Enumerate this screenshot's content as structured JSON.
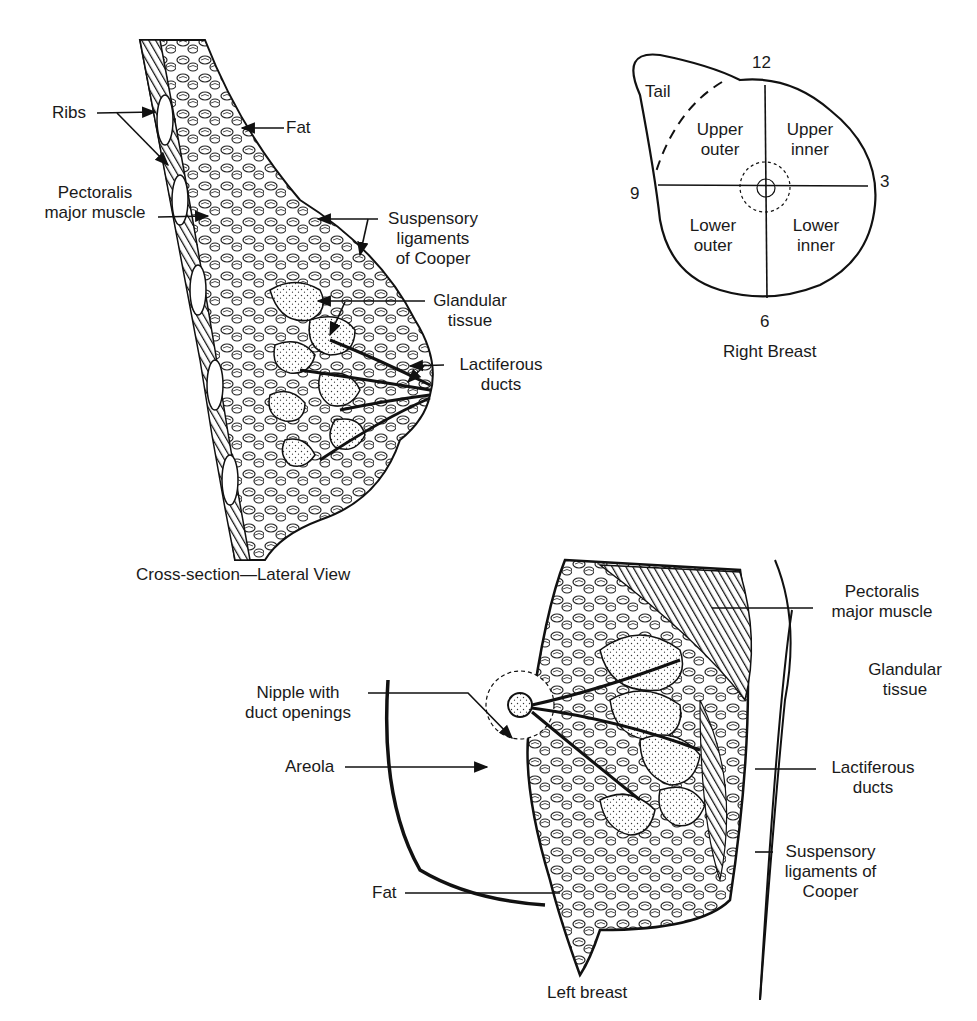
{
  "lateral_view": {
    "caption": "Cross-section—Lateral View",
    "labels": {
      "ribs": "Ribs",
      "fat": "Fat",
      "pectoralis_line1": "Pectoralis",
      "pectoralis_line2": "major muscle",
      "suspensory_line1": "Suspensory",
      "suspensory_line2": "ligaments",
      "suspensory_line3": "of Cooper",
      "glandular_line1": "Glandular",
      "glandular_line2": "tissue",
      "lactiferous_line1": "Lactiferous",
      "lactiferous_line2": "ducts"
    }
  },
  "quadrant_diagram": {
    "caption": "Right Breast",
    "clock": {
      "top": "12",
      "right": "3",
      "bottom": "6",
      "left": "9"
    },
    "regions": {
      "tail": "Tail",
      "upper_outer_1": "Upper",
      "upper_outer_2": "outer",
      "upper_inner_1": "Upper",
      "upper_inner_2": "inner",
      "lower_outer_1": "Lower",
      "lower_outer_2": "outer",
      "lower_inner_1": "Lower",
      "lower_inner_2": "inner"
    }
  },
  "frontal_view": {
    "caption": "Left breast",
    "labels": {
      "pectoralis_line1": "Pectoralis",
      "pectoralis_line2": "major muscle",
      "glandular_line1": "Glandular",
      "glandular_line2": "tissue",
      "nipple_line1": "Nipple with",
      "nipple_line2": "duct openings",
      "areola": "Areola",
      "lactiferous_line1": "Lactiferous",
      "lactiferous_line2": "ducts",
      "suspensory_line1": "Suspensory",
      "suspensory_line2": "ligaments of",
      "suspensory_line3": "Cooper",
      "fat": "Fat"
    }
  }
}
